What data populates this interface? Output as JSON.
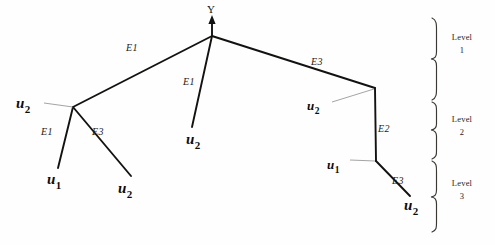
{
  "diagram": {
    "root": {
      "label": "Y",
      "x": 212,
      "y": 36
    },
    "edge_labels": [
      {
        "id": "e-root-left",
        "text": "E1",
        "x": 126,
        "y": 43
      },
      {
        "id": "e-root-mid",
        "text": "E1",
        "x": 183,
        "y": 77
      },
      {
        "id": "e-root-right",
        "text": "E3",
        "x": 311,
        "y": 57
      },
      {
        "id": "e-left-u1",
        "text": "E1",
        "x": 41,
        "y": 127
      },
      {
        "id": "e-left-u2",
        "text": "E3",
        "x": 92,
        "y": 127
      },
      {
        "id": "e-right-vert",
        "text": "E2",
        "x": 378,
        "y": 124
      },
      {
        "id": "e-right-u2",
        "text": "E3",
        "x": 392,
        "y": 176
      }
    ],
    "node_labels": [
      {
        "id": "n-left-junction",
        "base": "u",
        "sub": "2",
        "x": 16,
        "y": 96,
        "size": "big"
      },
      {
        "id": "n-left-u1",
        "base": "u",
        "sub": "1",
        "x": 47,
        "y": 172,
        "size": "big"
      },
      {
        "id": "n-left-u2",
        "base": "u",
        "sub": "2",
        "x": 118,
        "y": 181,
        "size": "big"
      },
      {
        "id": "n-mid-u2",
        "base": "u",
        "sub": "2",
        "x": 186,
        "y": 132,
        "size": "big"
      },
      {
        "id": "n-right-u2-top",
        "base": "u",
        "sub": "2",
        "x": 307,
        "y": 99,
        "size": "small"
      },
      {
        "id": "n-right-u1",
        "base": "u",
        "sub": "1",
        "x": 327,
        "y": 158,
        "size": "small"
      },
      {
        "id": "n-right-u2-bot",
        "base": "u",
        "sub": "2",
        "x": 404,
        "y": 198,
        "size": "big"
      }
    ],
    "levels": [
      {
        "id": "level-1",
        "name": "Level",
        "number": "1",
        "text_x": 447,
        "text_y": 31,
        "brace_top": 18,
        "brace_bottom": 100
      },
      {
        "id": "level-2",
        "name": "Level",
        "number": "2",
        "text_x": 447,
        "text_y": 113,
        "brace_top": 102,
        "brace_bottom": 159
      },
      {
        "id": "level-3",
        "name": "Level",
        "number": "3",
        "text_x": 447,
        "text_y": 177,
        "brace_top": 161,
        "brace_bottom": 232
      }
    ],
    "colors": {
      "stroke": "#131210",
      "leader": "#8d8d8d",
      "brace": "#3b3834",
      "background": "#fefefe"
    }
  },
  "geometry": {
    "edges": [
      {
        "id": "root-to-left",
        "points": "212,36 73,107"
      },
      {
        "id": "root-to-mid",
        "points": "212,36 192,127"
      },
      {
        "id": "root-to-right-corner",
        "points": "212,36 375,88"
      },
      {
        "id": "left-to-u1",
        "points": "73,107 58,168"
      },
      {
        "id": "left-to-u2",
        "points": "73,107 131,176"
      },
      {
        "id": "right-vertical",
        "points": "375,88 376,161"
      },
      {
        "id": "right-to-u2",
        "points": "376,161 410,196"
      }
    ],
    "leaders": [
      {
        "id": "leader-left-u2",
        "points": "44,103 73,107"
      },
      {
        "id": "leader-right-u2",
        "points": "332,102 374,89"
      },
      {
        "id": "leader-right-u1",
        "points": "350,160 375,161"
      }
    ],
    "root_arrow": {
      "shaft": "212,36 212,20",
      "tip": "212,16"
    }
  }
}
